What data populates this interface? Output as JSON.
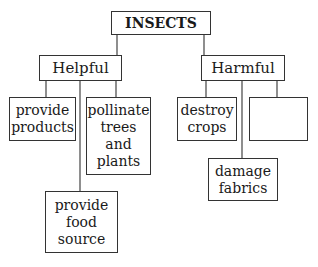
{
  "diagram": {
    "root": {
      "label": "INSECTS"
    },
    "helpful": {
      "label": "Helpful"
    },
    "harmful": {
      "label": "Harmful"
    },
    "helpful_children": [
      {
        "label": "provide\nproducts"
      },
      {
        "label": "pollinate\ntrees\nand\nplants"
      },
      {
        "label": "provide\nfood\nsource"
      }
    ],
    "harmful_children": [
      {
        "label": "destroy\ncrops"
      },
      {
        "label": ""
      },
      {
        "label": "damage\nfabrics"
      }
    ]
  }
}
